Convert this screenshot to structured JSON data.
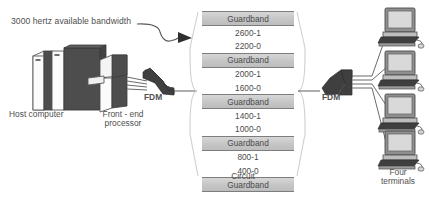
{
  "diagram": {
    "title_annotation": "3000 hertz available bandwidth",
    "labels": {
      "host": "Host computer",
      "front_end_processor": "Front -\nend\nprocessor",
      "fdm_left": "FDM",
      "fdm_right": "FDM",
      "circuit": "Circuit",
      "terminals": "Four\nterminals"
    },
    "icons": {
      "host_computer": "mainframe-cabinet-icon",
      "front_end_processor": "processor-icon",
      "fdm_left": "fdm-funnel-icon",
      "fdm_right": "fdm-funnel-icon",
      "terminal": "desktop-computer-icon",
      "annotation_arrow": "curved-arrow-icon"
    },
    "colors": {
      "guardband_fill": "#c9c9c9",
      "guardband_border": "#7d7d7d",
      "text": "#4f4f4f",
      "line": "#6b6b6b",
      "device_dark": "#4d4d4d",
      "device_light": "#f2f2f2"
    },
    "circuit": {
      "caption": "Circuit",
      "rows": [
        {
          "type": "guardband",
          "label": "Guardband"
        },
        {
          "type": "frequency",
          "label": "2600-1"
        },
        {
          "type": "frequency",
          "label": "2200-0"
        },
        {
          "type": "guardband",
          "label": "Guardband"
        },
        {
          "type": "frequency",
          "label": "2000-1"
        },
        {
          "type": "frequency",
          "label": "1600-0"
        },
        {
          "type": "guardband",
          "label": "Guardband"
        },
        {
          "type": "frequency",
          "label": "1400-1"
        },
        {
          "type": "frequency",
          "label": "1000-0"
        },
        {
          "type": "guardband",
          "label": "Guardband"
        },
        {
          "type": "frequency",
          "label": "800-1"
        },
        {
          "type": "frequency",
          "label": "400-0"
        },
        {
          "type": "guardband",
          "label": "Guardband"
        }
      ],
      "channels": [
        {
          "channel": 4,
          "mark_hz": 2600,
          "space_hz": 2200
        },
        {
          "channel": 3,
          "mark_hz": 2000,
          "space_hz": 1600
        },
        {
          "channel": 2,
          "mark_hz": 1400,
          "space_hz": 1000
        },
        {
          "channel": 1,
          "mark_hz": 800,
          "space_hz": 400
        }
      ],
      "guardband_count": 5,
      "total_bandwidth_hz": 3000
    },
    "terminal_count": 4
  }
}
